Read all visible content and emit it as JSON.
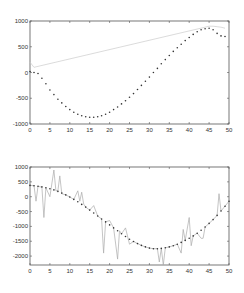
{
  "chart_data": [
    {
      "type": "line",
      "title": "",
      "xlabel": "",
      "ylabel": "",
      "xlim": [
        0,
        50
      ],
      "ylim": [
        -1000,
        1000
      ],
      "grid": false,
      "x_ticks": [
        "0",
        "5",
        "10",
        "15",
        "20",
        "25",
        "30",
        "35",
        "40",
        "45",
        "50"
      ],
      "y_ticks": [
        "1000",
        "500",
        "0",
        "-500",
        "-1000"
      ],
      "series": [
        {
          "name": "dotted fit",
          "style": "dotted",
          "color": "#333333",
          "x": [
            0,
            1,
            2,
            3,
            4,
            5,
            6,
            7,
            8,
            9,
            10,
            11,
            12,
            13,
            14,
            15,
            16,
            17,
            18,
            19,
            20,
            21,
            22,
            23,
            24,
            25,
            26,
            27,
            28,
            29,
            30,
            31,
            32,
            33,
            34,
            35,
            36,
            37,
            38,
            39,
            40,
            41,
            42,
            43,
            44,
            45,
            46,
            47,
            48,
            49
          ],
          "values": [
            20,
            0,
            -20,
            -110,
            -220,
            -340,
            -430,
            -520,
            -590,
            -660,
            -720,
            -770,
            -810,
            -840,
            -860,
            -870,
            -870,
            -860,
            -840,
            -810,
            -770,
            -720,
            -670,
            -610,
            -550,
            -480,
            -410,
            -330,
            -250,
            -170,
            -90,
            0,
            80,
            170,
            250,
            330,
            410,
            480,
            550,
            620,
            680,
            740,
            790,
            830,
            850,
            860,
            830,
            760,
            710,
            700
          ]
        },
        {
          "name": "faint reference",
          "style": "solid",
          "color": "#cccccc",
          "x": [
            0,
            1,
            44,
            45,
            46,
            47,
            48,
            49
          ],
          "values": [
            200,
            100,
            880,
            900,
            900,
            890,
            880,
            860
          ]
        }
      ]
    },
    {
      "type": "line",
      "title": "",
      "xlabel": "",
      "ylabel": "",
      "xlim": [
        0,
        50
      ],
      "ylim": [
        -2300,
        1000
      ],
      "grid": false,
      "x_ticks": [
        "0",
        "5",
        "10",
        "15",
        "20",
        "25",
        "30",
        "35",
        "40",
        "45",
        "50"
      ],
      "y_ticks": [
        "1000",
        "500",
        "0",
        "-500",
        "-1000",
        "-1500",
        "-2000"
      ],
      "series": [
        {
          "name": "dotted fit",
          "style": "dotted",
          "color": "#333333",
          "x": [
            0,
            1,
            2,
            3,
            4,
            5,
            6,
            7,
            8,
            9,
            10,
            11,
            12,
            13,
            14,
            15,
            16,
            17,
            18,
            19,
            20,
            21,
            22,
            23,
            24,
            25,
            26,
            27,
            28,
            29,
            30,
            31,
            32,
            33,
            34,
            35,
            36,
            37,
            38,
            39,
            40,
            41,
            42,
            43,
            44,
            45,
            46,
            47,
            48,
            49,
            50
          ],
          "values": [
            380,
            370,
            350,
            330,
            300,
            270,
            230,
            180,
            120,
            60,
            -10,
            -90,
            -170,
            -260,
            -350,
            -450,
            -550,
            -650,
            -750,
            -850,
            -950,
            -1050,
            -1150,
            -1250,
            -1340,
            -1430,
            -1510,
            -1580,
            -1640,
            -1690,
            -1730,
            -1750,
            -1750,
            -1740,
            -1720,
            -1690,
            -1650,
            -1600,
            -1540,
            -1470,
            -1400,
            -1320,
            -1230,
            -1130,
            -1020,
            -900,
            -770,
            -630,
            -480,
            -320,
            -150
          ]
        },
        {
          "name": "noisy signal",
          "style": "solid",
          "color": "#aaaaaa",
          "x": [
            0,
            1,
            1.5,
            2,
            3,
            3.5,
            4,
            5,
            6,
            6.5,
            7,
            7.5,
            8,
            9,
            10,
            11,
            12,
            12.5,
            13,
            13.5,
            14,
            15,
            16,
            17,
            18,
            18.5,
            19,
            20,
            21,
            22,
            22.5,
            23,
            24,
            25,
            26,
            27,
            28,
            29,
            30,
            31,
            32,
            32.5,
            33,
            33.5,
            34,
            35,
            36,
            37,
            38,
            38.5,
            39,
            40,
            40.5,
            41,
            42,
            43,
            43.5,
            44,
            45,
            46,
            47,
            47.5,
            48,
            49,
            50
          ],
          "values": [
            380,
            370,
            -150,
            350,
            320,
            -700,
            300,
            0,
            900,
            200,
            200,
            700,
            100,
            60,
            -10,
            -90,
            200,
            -150,
            150,
            -250,
            -350,
            -450,
            -300,
            -650,
            -750,
            -1900,
            -850,
            -800,
            -1050,
            -2100,
            -1150,
            -1250,
            -1050,
            -1600,
            -1510,
            -1580,
            -1640,
            -1690,
            -1730,
            -1750,
            -1750,
            -2200,
            -1740,
            -2300,
            -1720,
            -1690,
            -1650,
            -1600,
            -1900,
            -1100,
            -1470,
            -700,
            -1650,
            -1320,
            -1230,
            -1400,
            -1400,
            -1020,
            -900,
            -770,
            -630,
            100,
            -480,
            -320,
            -150
          ]
        }
      ]
    }
  ]
}
